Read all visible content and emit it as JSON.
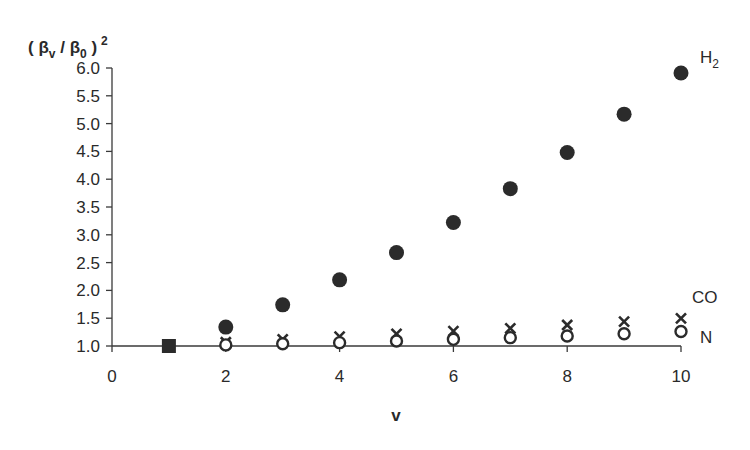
{
  "chart_data": {
    "type": "scatter",
    "title": "",
    "ylabel": "( βv / β0 )²",
    "ylabel_parts": {
      "open": "( ",
      "beta": "β",
      "sub_v": "v",
      "slash": " / ",
      "sub_0": "0",
      "close": " )",
      "sup": "2"
    },
    "xlabel": "v",
    "xlim": [
      0,
      10
    ],
    "ylim": [
      1.0,
      6.0
    ],
    "x_ticks": [
      "0",
      "2",
      "4",
      "6",
      "8",
      "10"
    ],
    "y_ticks": [
      "1.0",
      "1.5",
      "2.0",
      "2.5",
      "3.0",
      "3.5",
      "4.0",
      "4.5",
      "5.0",
      "5.5",
      "6.0"
    ],
    "grid": false,
    "legend_position": "inline-right",
    "series": [
      {
        "name": "H2",
        "label_main": "H",
        "label_sub": "2",
        "marker": "filled-circle",
        "x": [
          1,
          2,
          3,
          4,
          5,
          6,
          7,
          8,
          9,
          10
        ],
        "values": [
          1.0,
          1.34,
          1.74,
          2.19,
          2.68,
          3.22,
          3.83,
          4.48,
          5.17,
          5.91
        ]
      },
      {
        "name": "CO",
        "label_main": "CO",
        "marker": "x",
        "x": [
          1,
          2,
          3,
          4,
          5,
          6,
          7,
          8,
          9,
          10
        ],
        "values": [
          1.0,
          1.05,
          1.1,
          1.15,
          1.2,
          1.25,
          1.3,
          1.36,
          1.42,
          1.48
        ]
      },
      {
        "name": "N",
        "label_main": "N",
        "marker": "open-circle",
        "x": [
          1,
          2,
          3,
          4,
          5,
          6,
          7,
          8,
          9,
          10
        ],
        "values": [
          1.0,
          1.02,
          1.04,
          1.06,
          1.09,
          1.12,
          1.15,
          1.18,
          1.22,
          1.26
        ]
      }
    ]
  }
}
